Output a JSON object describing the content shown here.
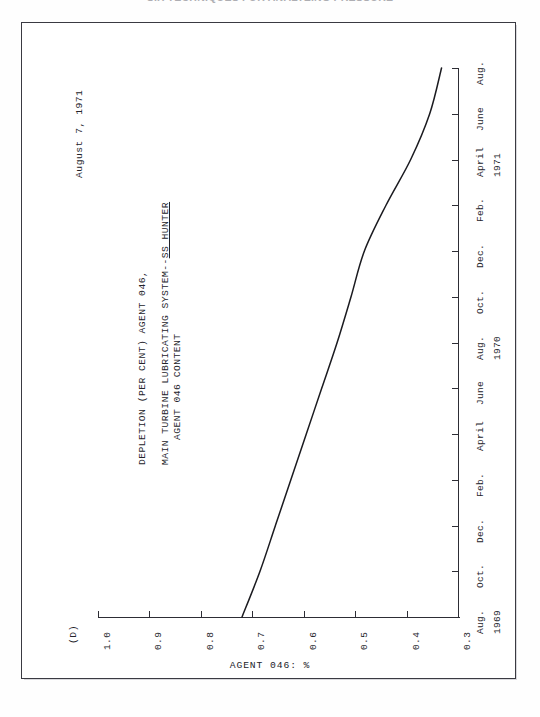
{
  "page": {
    "running_header": "SIX TECHNIQUES FOR ANALYZING PRESSURE",
    "panel_letter": "(D)",
    "date_stamp": "August 7, 1971"
  },
  "chart_data": {
    "type": "line",
    "orientation": "rotated-90-ccw",
    "title": "DEPLETION (PER CENT) AGENT 046,",
    "subtitle_prefix": "MAIN TURBINE LUBRICATING SYSTEM--",
    "subtitle_underlined": "SS HUNTER",
    "subtitle_line2": "AGENT 046 CONTENT",
    "xlabel": "",
    "ylabel": "AGENT 046: %",
    "grid": false,
    "legend": null,
    "ylim": [
      0.3,
      1.0
    ],
    "yticks": [
      "1.0",
      "0.9",
      "0.8",
      "0.7",
      "0.6",
      "0.5",
      "0.4",
      "0.3"
    ],
    "ytick_values": [
      1.0,
      0.9,
      0.8,
      0.7,
      0.6,
      0.5,
      0.4,
      0.3
    ],
    "xticks": [
      "Aug.",
      "Oct.",
      "Dec.",
      "Feb.",
      "April",
      "June",
      "Aug.",
      "Oct.",
      "Dec.",
      "Feb.",
      "April",
      "June",
      "Aug."
    ],
    "year_labels": [
      "1969",
      "1970",
      "1971"
    ],
    "x": [
      "Aug. 1969",
      "Oct. 1969",
      "Dec. 1969",
      "Feb. 1970",
      "April 1970",
      "June 1970",
      "Aug. 1970",
      "Oct. 1970",
      "Dec. 1970",
      "Feb. 1971",
      "April 1971",
      "June 1971",
      "Aug. 1971"
    ],
    "values": [
      0.72,
      0.685,
      0.655,
      0.625,
      0.595,
      0.565,
      0.535,
      0.508,
      0.482,
      0.44,
      0.392,
      0.355,
      0.332
    ]
  }
}
